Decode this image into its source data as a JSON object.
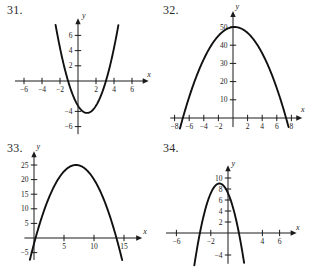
{
  "page": {
    "background_color": "#ffffff",
    "curve_color": "#111111",
    "axis_color": "#1b1b1b"
  },
  "problems": [
    {
      "number": "31.",
      "chart_data": {
        "type": "line",
        "title": "",
        "xlabel": "x",
        "ylabel": "y",
        "xlim": [
          -7.2,
          7.2
        ],
        "ylim": [
          -7.2,
          7.6
        ],
        "xticks": [
          -6,
          -4,
          -2,
          2,
          4,
          6
        ],
        "yticks": [
          2,
          4,
          6,
          -4,
          -6
        ],
        "xtick_labels": [
          "-6",
          "-4",
          "-2",
          "2",
          "4",
          "6"
        ],
        "ytick_labels": [
          "6",
          "4",
          "2",
          "-4",
          "-6"
        ],
        "grid": false,
        "legend": false,
        "curve": {
          "shape": "parabola",
          "opens": "up",
          "vertex": [
            1.0,
            -4.2
          ],
          "a": 0.95,
          "x_intercepts": [
            -1.1,
            3.1
          ],
          "y_intercept": -3.25,
          "equation": "y = 0.95(x - 1)^2 - 4.2"
        }
      }
    },
    {
      "number": "32.",
      "chart_data": {
        "type": "line",
        "title": "",
        "xlabel": "x",
        "ylabel": "y",
        "xlim": [
          -9.0,
          9.0
        ],
        "ylim": [
          -6,
          56
        ],
        "xticks": [
          -8,
          -6,
          -4,
          -2,
          2,
          4,
          6,
          8
        ],
        "yticks": [
          10,
          20,
          30,
          40,
          50
        ],
        "xtick_labels": [
          "-8",
          "-6",
          "-4",
          "-2",
          "2",
          "4",
          "6",
          "8"
        ],
        "ytick_labels": [
          "10",
          "20",
          "30",
          "40",
          "50"
        ],
        "grid": false,
        "legend": false,
        "curve": {
          "shape": "parabola",
          "opens": "down",
          "vertex": [
            0.2,
            50.0
          ],
          "a": -1.0,
          "x_intercepts": [
            -6.9,
            7.3
          ],
          "y_intercept": 50.0,
          "equation": "y = -1.0(x - 0.2)^2 + 50"
        }
      }
    },
    {
      "number": "33.",
      "chart_data": {
        "type": "line",
        "title": "",
        "xlabel": "x",
        "ylabel": "y",
        "xlim": [
          -2.2,
          17.5
        ],
        "ylim": [
          -8,
          29
        ],
        "xticks": [
          5,
          10,
          15
        ],
        "yticks": [
          5,
          10,
          15,
          20,
          25,
          -5
        ],
        "xtick_labels": [
          "5",
          "10",
          "15"
        ],
        "ytick_labels": [
          "25",
          "20",
          "15",
          "10",
          "5",
          "-5"
        ],
        "grid": false,
        "legend": false,
        "curve": {
          "shape": "parabola",
          "opens": "down",
          "vertex": [
            7.0,
            25.0
          ],
          "a": -0.55,
          "x_intercepts": [
            0.25,
            13.75
          ],
          "y_intercept": -2.0,
          "equation": "y = -0.55(x - 7)^2 + 25"
        }
      }
    },
    {
      "number": "34.",
      "chart_data": {
        "type": "line",
        "title": "",
        "xlabel": "x",
        "ylabel": "y",
        "xlim": [
          -7.6,
          7.6
        ],
        "ylim": [
          -6,
          12
        ],
        "xticks": [
          -6,
          -2,
          4,
          6
        ],
        "yticks": [
          2,
          4,
          6,
          8,
          10,
          -4
        ],
        "xtick_labels": [
          "-6",
          "-2",
          "4",
          "6"
        ],
        "ytick_labels": [
          "10",
          "8",
          "6",
          "4",
          "2",
          "-4"
        ],
        "grid": false,
        "legend": false,
        "curve": {
          "shape": "parabola",
          "opens": "down",
          "vertex": [
            -1.0,
            9.0
          ],
          "a": -1.75,
          "x_intercepts": [
            -3.27,
            1.27
          ],
          "y_intercept": 7.25,
          "equation": "y = -1.75(x + 1)^2 + 9"
        }
      }
    }
  ]
}
